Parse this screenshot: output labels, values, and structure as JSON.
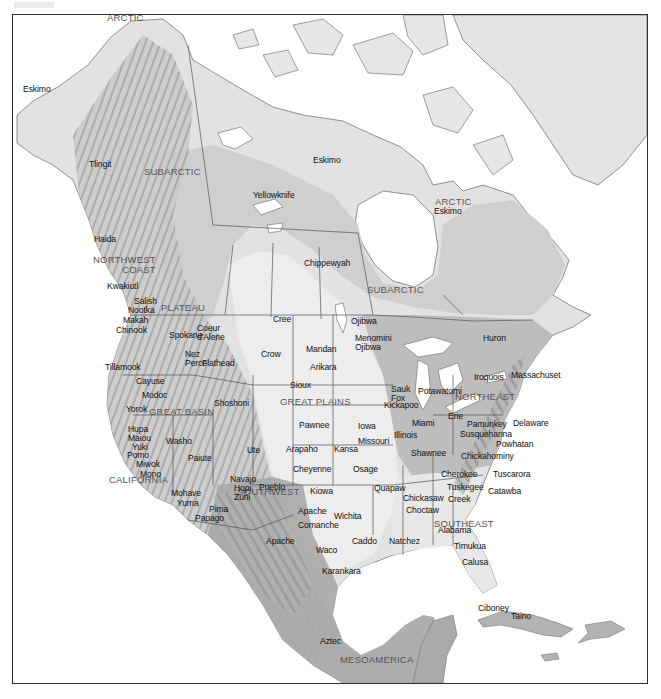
{
  "map": {
    "title": "",
    "culture_areas": [
      {
        "name": "ARCTIC",
        "x": 106,
        "y": 12
      },
      {
        "name": "SUBARCTIC",
        "x": 143,
        "y": 166
      },
      {
        "name": "ARCTIC",
        "x": 434,
        "y": 196
      },
      {
        "name": "SUBARCTIC",
        "x": 366,
        "y": 284
      },
      {
        "name": "NORTHWEST\nCOAST",
        "x": 92,
        "y": 254
      },
      {
        "name": "PLATEAU",
        "x": 160,
        "y": 302
      },
      {
        "name": "GREAT BASIN",
        "x": 148,
        "y": 406
      },
      {
        "name": "CALIFORNIA",
        "x": 108,
        "y": 474
      },
      {
        "name": "SOUTHWEST",
        "x": 236,
        "y": 486
      },
      {
        "name": "GREAT PLAINS",
        "x": 279,
        "y": 396
      },
      {
        "name": "NORTHEAST",
        "x": 454,
        "y": 391
      },
      {
        "name": "SOUTHEAST",
        "x": 433,
        "y": 518
      },
      {
        "name": "MESOAMERICA",
        "x": 339,
        "y": 654
      }
    ],
    "peoples": [
      {
        "name": "Eskimo",
        "x": 22,
        "y": 84
      },
      {
        "name": "Tlingit",
        "x": 88,
        "y": 159
      },
      {
        "name": "Eskimo",
        "x": 312,
        "y": 155
      },
      {
        "name": "Yellowknife",
        "x": 252,
        "y": 190
      },
      {
        "name": "Eskimo",
        "x": 433,
        "y": 206
      },
      {
        "name": "Chippewyah",
        "x": 303,
        "y": 258
      },
      {
        "name": "Haida",
        "x": 93,
        "y": 234
      },
      {
        "name": "Kwakiutl",
        "x": 106,
        "y": 281
      },
      {
        "name": "Salish",
        "x": 133,
        "y": 296
      },
      {
        "name": "Nootka",
        "x": 127,
        "y": 305
      },
      {
        "name": "Makah",
        "x": 122,
        "y": 315
      },
      {
        "name": "Chinook",
        "x": 115,
        "y": 325
      },
      {
        "name": "Cree",
        "x": 272,
        "y": 314
      },
      {
        "name": "Spokane",
        "x": 168,
        "y": 330
      },
      {
        "name": "Coeur\nd'Alene",
        "x": 196,
        "y": 323
      },
      {
        "name": "Ojibwa",
        "x": 350,
        "y": 316
      },
      {
        "name": "Huron",
        "x": 482,
        "y": 333
      },
      {
        "name": "Mandan",
        "x": 305,
        "y": 344
      },
      {
        "name": "Menomini\nOjibwa",
        "x": 354,
        "y": 333
      },
      {
        "name": "Crow",
        "x": 260,
        "y": 349
      },
      {
        "name": "Nez\nPerce",
        "x": 184,
        "y": 349
      },
      {
        "name": "Flathead",
        "x": 201,
        "y": 358
      },
      {
        "name": "Tillamook",
        "x": 104,
        "y": 362
      },
      {
        "name": "Arikara",
        "x": 309,
        "y": 362
      },
      {
        "name": "Iroquois",
        "x": 473,
        "y": 372
      },
      {
        "name": "Massachuset",
        "x": 510,
        "y": 370
      },
      {
        "name": "Sauk\nFox",
        "x": 390,
        "y": 384
      },
      {
        "name": "Potawatomi",
        "x": 417,
        "y": 386
      },
      {
        "name": "Cayuse",
        "x": 135,
        "y": 376
      },
      {
        "name": "Sioux",
        "x": 289,
        "y": 380
      },
      {
        "name": "Kickapoo",
        "x": 383,
        "y": 400
      },
      {
        "name": "Modoc",
        "x": 141,
        "y": 390
      },
      {
        "name": "Shoshoni",
        "x": 213,
        "y": 398
      },
      {
        "name": "Erie",
        "x": 447,
        "y": 411
      },
      {
        "name": "Miami",
        "x": 411,
        "y": 418
      },
      {
        "name": "Pamunkey",
        "x": 466,
        "y": 419
      },
      {
        "name": "Delaware",
        "x": 512,
        "y": 418
      },
      {
        "name": "Yorok",
        "x": 125,
        "y": 404
      },
      {
        "name": "Iowa",
        "x": 357,
        "y": 421
      },
      {
        "name": "Pawnee",
        "x": 298,
        "y": 420
      },
      {
        "name": "Susquehanna",
        "x": 459,
        "y": 429
      },
      {
        "name": "Illinois",
        "x": 393,
        "y": 430
      },
      {
        "name": "Missouri",
        "x": 357,
        "y": 436
      },
      {
        "name": "Hupa",
        "x": 127,
        "y": 424
      },
      {
        "name": "Maiou",
        "x": 127,
        "y": 433
      },
      {
        "name": "Yuki",
        "x": 131,
        "y": 442
      },
      {
        "name": "Pomo",
        "x": 126,
        "y": 450
      },
      {
        "name": "Miwok",
        "x": 135,
        "y": 459
      },
      {
        "name": "Mono",
        "x": 139,
        "y": 469
      },
      {
        "name": "Washo",
        "x": 165,
        "y": 436
      },
      {
        "name": "Arapaho",
        "x": 285,
        "y": 444
      },
      {
        "name": "Kansa",
        "x": 333,
        "y": 444
      },
      {
        "name": "Powhatan",
        "x": 495,
        "y": 439
      },
      {
        "name": "Paiute",
        "x": 187,
        "y": 453
      },
      {
        "name": "Ute",
        "x": 246,
        "y": 445
      },
      {
        "name": "Shawnee",
        "x": 410,
        "y": 448
      },
      {
        "name": "Chickahominy",
        "x": 460,
        "y": 451
      },
      {
        "name": "Cheyenne",
        "x": 292,
        "y": 464
      },
      {
        "name": "Osage",
        "x": 352,
        "y": 464
      },
      {
        "name": "Cherokee",
        "x": 440,
        "y": 469
      },
      {
        "name": "Tuscarora",
        "x": 492,
        "y": 469
      },
      {
        "name": "Navajo",
        "x": 229,
        "y": 474
      },
      {
        "name": "Pueblo",
        "x": 258,
        "y": 482
      },
      {
        "name": "Hopi",
        "x": 233,
        "y": 483
      },
      {
        "name": "Zuni",
        "x": 233,
        "y": 492
      },
      {
        "name": "Quapaw",
        "x": 373,
        "y": 483
      },
      {
        "name": "Tuskegee",
        "x": 446,
        "y": 482
      },
      {
        "name": "Catawba",
        "x": 487,
        "y": 486
      },
      {
        "name": "Kiowa",
        "x": 309,
        "y": 486
      },
      {
        "name": "Chickasaw",
        "x": 402,
        "y": 493
      },
      {
        "name": "Creek",
        "x": 447,
        "y": 494
      },
      {
        "name": "Mohave",
        "x": 170,
        "y": 488
      },
      {
        "name": "Yuma",
        "x": 176,
        "y": 498
      },
      {
        "name": "Pima",
        "x": 208,
        "y": 504
      },
      {
        "name": "Papago",
        "x": 194,
        "y": 513
      },
      {
        "name": "Choctaw",
        "x": 405,
        "y": 505
      },
      {
        "name": "Apache",
        "x": 297,
        "y": 506
      },
      {
        "name": "Wichita",
        "x": 333,
        "y": 511
      },
      {
        "name": "Alabama",
        "x": 437,
        "y": 525
      },
      {
        "name": "Comanche",
        "x": 297,
        "y": 520
      },
      {
        "name": "Caddo",
        "x": 351,
        "y": 536
      },
      {
        "name": "Natchez",
        "x": 388,
        "y": 536
      },
      {
        "name": "Apache",
        "x": 265,
        "y": 536
      },
      {
        "name": "Timukua",
        "x": 453,
        "y": 541
      },
      {
        "name": "Waco",
        "x": 315,
        "y": 545
      },
      {
        "name": "Calusa",
        "x": 461,
        "y": 557
      },
      {
        "name": "Karankara",
        "x": 321,
        "y": 566
      },
      {
        "name": "Ciboney",
        "x": 477,
        "y": 603
      },
      {
        "name": "Taino",
        "x": 510,
        "y": 611
      },
      {
        "name": "Aztec",
        "x": 319,
        "y": 636
      }
    ]
  },
  "colors": {
    "background": "#ffffff",
    "water": "#ffffff",
    "land_light": "#e6e6e6",
    "land_mid": "#cfcfcf",
    "land_dark": "#a9a9a9",
    "relief_shadow": "#8c8c8c",
    "border_line": "#555555",
    "frame": "#333333",
    "region_label": "#555555",
    "people_label": "#111111"
  }
}
